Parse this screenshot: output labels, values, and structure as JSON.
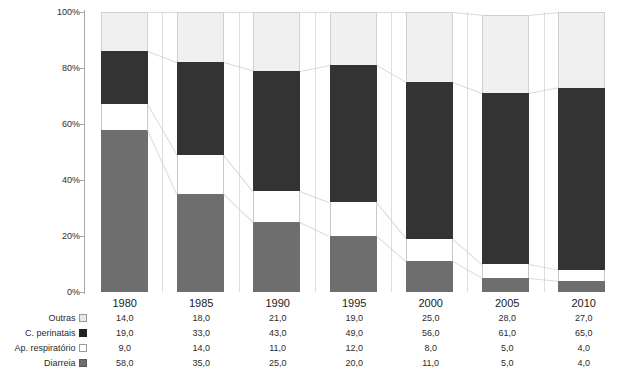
{
  "chart_data": {
    "type": "bar",
    "stacked": true,
    "stack_mode": "percent",
    "title": "",
    "subtitle": "",
    "xlabel": "",
    "ylabel": "",
    "ylim": [
      0,
      100
    ],
    "ytick_labels": [
      "100%",
      "80%",
      "60%",
      "40%",
      "20%",
      "0%"
    ],
    "ytick_values": [
      100,
      80,
      60,
      40,
      20,
      0
    ],
    "grid": false,
    "legend_position": "table-row-labels",
    "categories": [
      "1980",
      "1985",
      "1990",
      "1995",
      "2000",
      "2005",
      "2010"
    ],
    "stack_order_bottom_to_top": [
      "Diarreia",
      "Ap. respiratório",
      "C. perinatais",
      "Outras"
    ],
    "series": [
      {
        "name": "Outras",
        "color": "#f0f0f0",
        "values": [
          14.0,
          18.0,
          21.0,
          19.0,
          25.0,
          28.0,
          27.0
        ]
      },
      {
        "name": "C. perinatais",
        "color": "#333333",
        "values": [
          19.0,
          33.0,
          43.0,
          49.0,
          56.0,
          61.0,
          65.0
        ]
      },
      {
        "name": "Ap. respiratório",
        "color": "#ffffff",
        "values": [
          9.0,
          14.0,
          11.0,
          12.0,
          8.0,
          5.0,
          4.0
        ]
      },
      {
        "name": "Diarreia",
        "color": "#6e6e6e",
        "values": [
          58.0,
          35.0,
          25.0,
          20.0,
          11.0,
          5.0,
          4.0
        ]
      }
    ]
  },
  "table": {
    "corner_label": "",
    "column_headers": [
      "1980",
      "1985",
      "1990",
      "1995",
      "2000",
      "2005",
      "2010"
    ],
    "rows": [
      {
        "label": "Outras",
        "swatch": "light-gray-swatch-icon",
        "values": [
          "14,0",
          "18,0",
          "21,0",
          "19,0",
          "25,0",
          "28,0",
          "27,0"
        ]
      },
      {
        "label": "C. perinatais",
        "swatch": "black-swatch-icon",
        "values": [
          "19,0",
          "33,0",
          "43,0",
          "49,0",
          "56,0",
          "61,0",
          "65,0"
        ]
      },
      {
        "label": "Ap. respiratório",
        "swatch": "white-swatch-icon",
        "values": [
          "9,0",
          "14,0",
          "11,0",
          "12,0",
          "8,0",
          "5,0",
          "4,0"
        ]
      },
      {
        "label": "Diarreia",
        "swatch": "medium-gray-swatch-icon",
        "values": [
          "58,0",
          "35,0",
          "25,0",
          "20,0",
          "11,0",
          "5,0",
          "4,0"
        ]
      }
    ]
  },
  "colors": {
    "outras": "#f0f0f0",
    "perinatais": "#333333",
    "respiratorio": "#ffffff",
    "diarreia": "#6e6e6e",
    "axis": "#a8a8a8",
    "grid": "#dedede",
    "table_border": "#9a9a9a",
    "background": "#ffffff"
  }
}
